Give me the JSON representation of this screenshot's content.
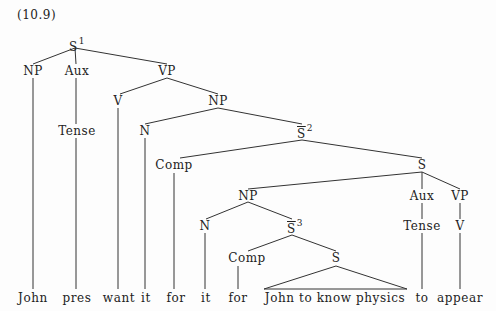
{
  "caption": "(10.9)",
  "nodes": {
    "s1": {
      "label": "S",
      "sup": "1"
    },
    "np1": {
      "label": "NP"
    },
    "aux1": {
      "label": "Aux"
    },
    "vp1": {
      "label": "VP"
    },
    "v1": {
      "label": "V"
    },
    "np2": {
      "label": "NP"
    },
    "tense1": {
      "label": "Tense"
    },
    "n1": {
      "label": "N"
    },
    "sbar2": {
      "label": "S",
      "sup": "2"
    },
    "comp1": {
      "label": "Comp"
    },
    "s2": {
      "label": "S"
    },
    "np3": {
      "label": "NP"
    },
    "aux2": {
      "label": "Aux"
    },
    "vp2": {
      "label": "VP"
    },
    "n2": {
      "label": "N"
    },
    "sbar3": {
      "label": "S",
      "sup": "3"
    },
    "tense2": {
      "label": "Tense"
    },
    "v2": {
      "label": "V"
    },
    "comp2": {
      "label": "Comp"
    },
    "s3": {
      "label": "S"
    }
  },
  "leaves": [
    "John",
    "pres",
    "want",
    "it",
    "for",
    "it",
    "for",
    "John to know physics",
    "to",
    "appear"
  ]
}
